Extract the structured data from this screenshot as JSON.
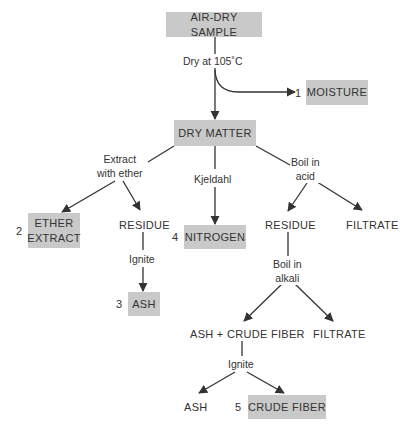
{
  "diagram": {
    "colors": {
      "box_fill": "#c9c9c9",
      "text": "#333333",
      "line": "#333333"
    },
    "nodes": {
      "air_dry_sample": "AIR-DRY SAMPLE",
      "moisture": "MOISTURE",
      "dry_matter": "DRY MATTER",
      "ether_extract_line1": "ETHER",
      "ether_extract_line2": "EXTRACT",
      "residue_ether": "RESIDUE",
      "ash": "ASH",
      "nitrogen": "NITROGEN",
      "residue_acid": "RESIDUE",
      "filtrate_acid": "FILTRATE",
      "ash_crude_fiber": "ASH + CRUDE FIBER",
      "filtrate_alkali": "FILTRATE",
      "ash_final": "ASH",
      "crude_fiber": "CRUDE FIBER"
    },
    "numbers": {
      "moisture": "1",
      "ether_extract": "2",
      "ash": "3",
      "nitrogen": "4",
      "crude_fiber": "5"
    },
    "edge_labels": {
      "dry": "Dry at 105˚C",
      "extract_line1": "Extract",
      "extract_line2": "with ether",
      "kjeldahl": "Kjeldahl",
      "boil_acid_line1": "Boil in",
      "boil_acid_line2": "acid",
      "ignite_1": "Ignite",
      "boil_alkali_line1": "Boil in",
      "boil_alkali_line2": "alkali",
      "ignite_2": "Ignite"
    }
  }
}
